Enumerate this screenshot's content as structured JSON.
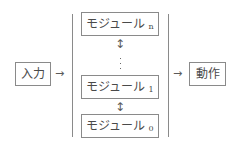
{
  "diagram": {
    "input": {
      "label": "入力"
    },
    "output": {
      "label": "動作"
    },
    "modules": [
      {
        "label": "モジュール",
        "index": "n"
      },
      {
        "label": "モジュール",
        "index": "1"
      },
      {
        "label": "モジュール",
        "index": "0"
      }
    ],
    "connectors": {
      "input_to_stack": "→",
      "stack_to_output": "→",
      "between_modules": "↕",
      "ellipsis": "⋮"
    },
    "colors": {
      "border": "#8a8a8a",
      "text": "#4a4a4a",
      "background": "#ffffff"
    }
  }
}
